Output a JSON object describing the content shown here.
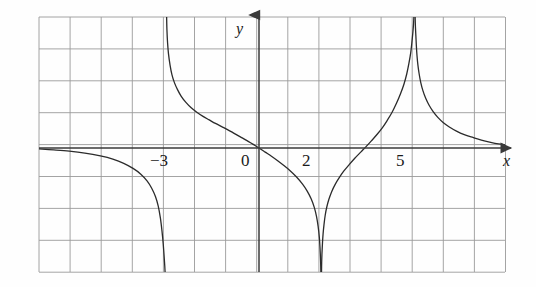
{
  "figure": {
    "name": "rational-function-graph",
    "background_color": "#fefefe",
    "width": 536,
    "height": 287
  },
  "axes": {
    "x_axis_label": "x",
    "y_axis_label": "y",
    "x_axis_color": "#3a3a3a",
    "y_axis_color": "#3a3a3a",
    "origin_px": {
      "x": 259,
      "y": 148
    },
    "unit_px": {
      "x": 31.1,
      "y": 31.9
    }
  },
  "grid": {
    "color": "#9a9a9a",
    "line_width": 0.9,
    "columns": 15,
    "rows": 8,
    "left_px": 39,
    "top_px": 17,
    "right_px": 505,
    "bottom_px": 272,
    "cell_width_px": 31.1,
    "cell_height_px": 31.9,
    "show": true
  },
  "tick_labels": [
    {
      "text": "−3",
      "value": -3,
      "x_px": 150,
      "y_px": 166
    },
    {
      "text": "0",
      "value": 0,
      "x_px": 241,
      "y_px": 166
    },
    {
      "text": "2",
      "value": 2,
      "x_px": 302,
      "y_px": 166
    },
    {
      "text": "5",
      "value": 5,
      "x_px": 396,
      "y_px": 166
    }
  ],
  "curve": {
    "color": "#2b2b2b",
    "line_width": 1.3,
    "fill": "none"
  },
  "chart_data": {
    "type": "line",
    "title": "",
    "xlabel": "x",
    "ylabel": "y",
    "grid": true,
    "legend": false,
    "xlim": [
      -7.07,
      7.91
    ],
    "ylim": [
      -3.89,
      4.11
    ],
    "xticks": [
      -3,
      0,
      2,
      5
    ],
    "yticks": [],
    "vertical_asymptotes": [
      -3,
      2,
      5
    ],
    "horizontal_asymptote": 0,
    "x_intercepts": [
      0
    ],
    "y_intercepts": [
      0
    ],
    "series": [
      {
        "name": "branch-1",
        "domain": [
          -7.07,
          -3
        ],
        "end_behavior": {
          "left": "approaches 0 from below",
          "right": "tends to -infinity"
        },
        "points": [
          [
            -7.07,
            -0.03
          ],
          [
            -6.6,
            -0.06
          ],
          [
            -6.1,
            -0.1
          ],
          [
            -5.6,
            -0.16
          ],
          [
            -5.1,
            -0.25
          ],
          [
            -4.7,
            -0.35
          ],
          [
            -4.35,
            -0.48
          ],
          [
            -4.05,
            -0.64
          ],
          [
            -3.8,
            -0.82
          ],
          [
            -3.6,
            -1.03
          ],
          [
            -3.45,
            -1.26
          ],
          [
            -3.33,
            -1.52
          ],
          [
            -3.24,
            -1.82
          ],
          [
            -3.17,
            -2.2
          ],
          [
            -3.12,
            -2.6
          ],
          [
            -3.08,
            -3.0
          ],
          [
            -3.05,
            -3.4
          ],
          [
            -3.03,
            -3.7
          ],
          [
            -3.02,
            -3.89
          ]
        ]
      },
      {
        "name": "branch-2",
        "domain": [
          -3,
          2
        ],
        "end_behavior": {
          "left": "tends to +infinity",
          "right": "tends to -infinity"
        },
        "points": [
          [
            -2.97,
            4.11
          ],
          [
            -2.96,
            3.7
          ],
          [
            -2.94,
            3.3
          ],
          [
            -2.91,
            2.95
          ],
          [
            -2.86,
            2.6
          ],
          [
            -2.8,
            2.3
          ],
          [
            -2.72,
            2.05
          ],
          [
            -2.62,
            1.83
          ],
          [
            -2.5,
            1.62
          ],
          [
            -2.35,
            1.43
          ],
          [
            -2.18,
            1.26
          ],
          [
            -2.0,
            1.12
          ],
          [
            -1.8,
            0.99
          ],
          [
            -1.6,
            0.88
          ],
          [
            -1.4,
            0.77
          ],
          [
            -1.2,
            0.67
          ],
          [
            -1.0,
            0.57
          ],
          [
            -0.8,
            0.46
          ],
          [
            -0.6,
            0.35
          ],
          [
            -0.4,
            0.24
          ],
          [
            -0.2,
            0.12
          ],
          [
            0.0,
            0.0
          ],
          [
            0.2,
            -0.13
          ],
          [
            0.4,
            -0.26
          ],
          [
            0.6,
            -0.4
          ],
          [
            0.8,
            -0.55
          ],
          [
            1.0,
            -0.71
          ],
          [
            1.2,
            -0.9
          ],
          [
            1.4,
            -1.13
          ],
          [
            1.55,
            -1.35
          ],
          [
            1.68,
            -1.6
          ],
          [
            1.78,
            -1.87
          ],
          [
            1.85,
            -2.15
          ],
          [
            1.9,
            -2.45
          ],
          [
            1.94,
            -2.8
          ],
          [
            1.96,
            -3.1
          ],
          [
            1.975,
            -3.4
          ],
          [
            1.985,
            -3.7
          ],
          [
            1.99,
            -3.89
          ]
        ]
      },
      {
        "name": "branch-3",
        "domain": [
          2,
          5
        ],
        "end_behavior": {
          "left": "tends to -infinity",
          "right": "tends to +infinity"
        },
        "points": [
          [
            2.01,
            -3.89
          ],
          [
            2.015,
            -3.6
          ],
          [
            2.025,
            -3.3
          ],
          [
            2.04,
            -3.0
          ],
          [
            2.06,
            -2.7
          ],
          [
            2.09,
            -2.4
          ],
          [
            2.13,
            -2.1
          ],
          [
            2.18,
            -1.85
          ],
          [
            2.25,
            -1.6
          ],
          [
            2.34,
            -1.36
          ],
          [
            2.45,
            -1.14
          ],
          [
            2.58,
            -0.93
          ],
          [
            2.73,
            -0.72
          ],
          [
            2.9,
            -0.52
          ],
          [
            3.08,
            -0.32
          ],
          [
            3.28,
            -0.12
          ],
          [
            3.45,
            0.05
          ],
          [
            3.62,
            0.23
          ],
          [
            3.8,
            0.43
          ],
          [
            3.97,
            0.64
          ],
          [
            4.12,
            0.86
          ],
          [
            4.28,
            1.12
          ],
          [
            4.42,
            1.4
          ],
          [
            4.55,
            1.7
          ],
          [
            4.66,
            2.0
          ],
          [
            4.75,
            2.32
          ],
          [
            4.82,
            2.65
          ],
          [
            4.88,
            3.0
          ],
          [
            4.92,
            3.35
          ],
          [
            4.95,
            3.65
          ],
          [
            4.97,
            3.9
          ],
          [
            4.98,
            4.11
          ]
        ]
      },
      {
        "name": "branch-4",
        "domain": [
          5,
          7.91
        ],
        "end_behavior": {
          "left": "tends to +infinity",
          "right": "approaches 0 from above"
        },
        "points": [
          [
            5.02,
            4.11
          ],
          [
            5.03,
            3.8
          ],
          [
            5.045,
            3.5
          ],
          [
            5.06,
            3.2
          ],
          [
            5.08,
            2.9
          ],
          [
            5.11,
            2.6
          ],
          [
            5.15,
            2.32
          ],
          [
            5.2,
            2.06
          ],
          [
            5.27,
            1.8
          ],
          [
            5.36,
            1.56
          ],
          [
            5.47,
            1.34
          ],
          [
            5.6,
            1.14
          ],
          [
            5.75,
            0.96
          ],
          [
            5.92,
            0.8
          ],
          [
            6.12,
            0.66
          ],
          [
            6.35,
            0.53
          ],
          [
            6.6,
            0.42
          ],
          [
            6.88,
            0.33
          ],
          [
            7.15,
            0.25
          ],
          [
            7.45,
            0.18
          ],
          [
            7.7,
            0.13
          ],
          [
            7.91,
            0.1
          ]
        ]
      }
    ]
  }
}
